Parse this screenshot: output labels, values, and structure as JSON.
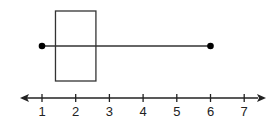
{
  "chart_data": {
    "type": "boxplot",
    "title": "",
    "xlabel": "",
    "ylabel": "",
    "min": 1,
    "q1": 1.4,
    "q3": 2.6,
    "median": null,
    "max": 6,
    "axis": {
      "ticks": [
        1,
        2,
        3,
        4,
        5,
        6,
        7
      ],
      "tick_labels": [
        "1",
        "2",
        "3",
        "4",
        "5",
        "6",
        "7"
      ],
      "range": [
        0.6,
        7.7
      ],
      "arrows": "both ends"
    },
    "grid": false,
    "legend": null
  },
  "colors": {
    "stroke": "#333333",
    "point": "#000000"
  }
}
